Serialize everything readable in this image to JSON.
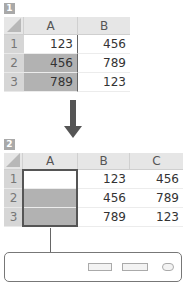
{
  "steps": {
    "one": "1",
    "two": "2"
  },
  "table1": {
    "columns": [
      "A",
      "B"
    ],
    "rows": [
      {
        "label": "1",
        "cells": [
          "123",
          "456"
        ]
      },
      {
        "label": "2",
        "cells": [
          "456",
          "789"
        ]
      },
      {
        "label": "3",
        "cells": [
          "789",
          "123"
        ]
      }
    ]
  },
  "table2": {
    "columns": [
      "A",
      "B",
      "C"
    ],
    "rows": [
      {
        "label": "1",
        "cells": [
          "",
          "123",
          "456"
        ]
      },
      {
        "label": "2",
        "cells": [
          "",
          "456",
          "789"
        ]
      },
      {
        "label": "3",
        "cells": [
          "",
          "789",
          "123"
        ]
      }
    ]
  },
  "colors": {
    "selection": "#b2b2b2",
    "header": "#e6e6e6",
    "row_header": "#d6d6d6",
    "arrow": "#555555"
  }
}
